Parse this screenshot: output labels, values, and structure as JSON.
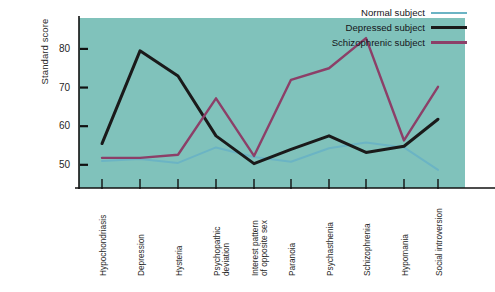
{
  "chart_data": {
    "type": "line",
    "title": "",
    "xlabel": "",
    "ylabel": "Standard score",
    "ylim": [
      44,
      88
    ],
    "yticks": [
      50,
      60,
      70,
      80
    ],
    "ytick_labels": [
      "50",
      "60",
      "70",
      "80"
    ],
    "grid": false,
    "legend_position": "top-right",
    "plot_background": "#80c2bb",
    "categories": [
      "Hypochondriasis",
      "Depression",
      "Hysteria",
      "Psychopathic deviation",
      "Interest pattern of opposite sex",
      "Paranoia",
      "Psychasthenia",
      "Schizophrenia",
      "Hypomania",
      "Social introversion"
    ],
    "category_lines": [
      [
        "Hypochondriasis"
      ],
      [
        "Depression"
      ],
      [
        "Hysteria"
      ],
      [
        "Psychopathic",
        "deviation"
      ],
      [
        "Interest pattern",
        "of opposite sex"
      ],
      [
        "Paranoia"
      ],
      [
        "Psychasthenia"
      ],
      [
        "Schizophrenia"
      ],
      [
        "Hypomania"
      ],
      [
        "Social introversion"
      ]
    ],
    "series": [
      {
        "name": "Normal subject",
        "color": "#6bb4c4",
        "width": 2,
        "values": [
          51.0,
          51.5,
          50.5,
          54.5,
          52.0,
          50.8,
          54.3,
          55.8,
          54.5,
          48.7
        ]
      },
      {
        "name": "Depressed subject",
        "color": "#1a1a1a",
        "width": 3,
        "values": [
          55.5,
          79.5,
          73.0,
          57.5,
          50.3,
          54.0,
          57.5,
          53.2,
          54.8,
          61.8
        ]
      },
      {
        "name": "Schizophrenic subject",
        "color": "#8c3f68",
        "width": 2.4,
        "values": [
          51.8,
          51.8,
          52.6,
          67.2,
          52.3,
          72.0,
          75.0,
          82.8,
          56.3,
          70.2
        ]
      }
    ]
  },
  "legend": {
    "items": [
      {
        "label": "Normal subject",
        "color": "#6bb4c4"
      },
      {
        "label": "Depressed subject",
        "color": "#1a1a1a"
      },
      {
        "label": "Schizophrenic subject",
        "color": "#8c3f68"
      }
    ]
  },
  "axes": {
    "y_title": "Standard score"
  }
}
